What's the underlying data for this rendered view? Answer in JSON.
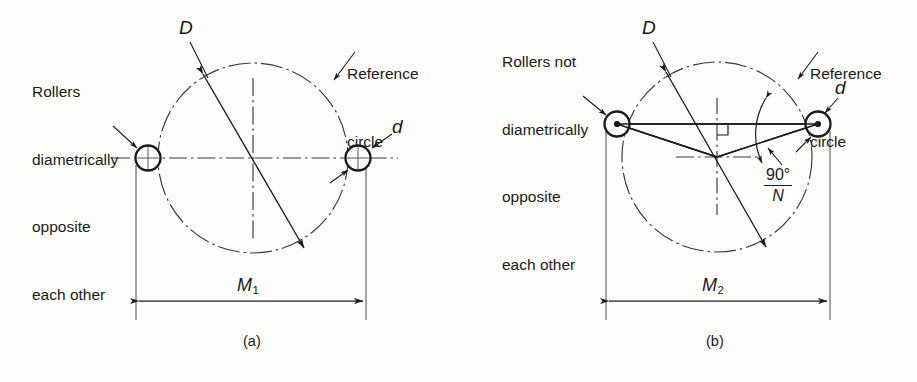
{
  "figure": {
    "background_color": "#fdfdfc",
    "ink_color": "#1a1a1a",
    "panels": [
      {
        "id": "a",
        "caption": "(a)",
        "note": {
          "lines": [
            "Rollers",
            "diametrically",
            "opposite",
            "each other"
          ]
        },
        "reference_label": {
          "lines": [
            "Reference",
            "circle"
          ]
        },
        "diameter_symbol": "D",
        "roller_symbol": "d",
        "dimension": {
          "label": "M",
          "subscript": "1"
        },
        "angle": null,
        "circle": {
          "cx": 253,
          "cy": 158,
          "r": 95
        },
        "rollers": [
          {
            "cx": 148,
            "cy": 158,
            "r": 12.5,
            "center_dot": false
          },
          {
            "cx": 358,
            "cy": 158,
            "r": 12.5,
            "center_dot": false
          }
        ]
      },
      {
        "id": "b",
        "caption": "(b)",
        "note": {
          "lines": [
            "Rollers not",
            "diametrically",
            "opposite",
            "each other"
          ]
        },
        "reference_label": {
          "lines": [
            "Reference",
            "circle"
          ]
        },
        "diameter_symbol": "D",
        "roller_symbol": "d",
        "dimension": {
          "label": "M",
          "subscript": "2"
        },
        "angle": {
          "numerator": "90°",
          "denominator": "N"
        },
        "circle": {
          "cx": 717,
          "cy": 157,
          "r": 95
        },
        "rollers": [
          {
            "cx": 617,
            "cy": 124,
            "r": 12.5,
            "center_dot": true
          },
          {
            "cx": 818,
            "cy": 124,
            "r": 12.5,
            "center_dot": true
          }
        ]
      }
    ]
  }
}
